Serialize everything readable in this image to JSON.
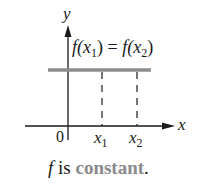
{
  "diagram": {
    "axes": {
      "y_label": "y",
      "x_label": "x",
      "origin_label": "0"
    },
    "points": [
      {
        "name": "x",
        "sub": "1"
      },
      {
        "name": "x",
        "sub": "2"
      }
    ],
    "equation": {
      "lhs_fn": "f(",
      "lhs_var": "x",
      "lhs_sub": "1",
      "lhs_close": ")",
      "op": " = ",
      "rhs_fn": "f(",
      "rhs_var": "x",
      "rhs_sub": "2",
      "rhs_close": ")"
    },
    "caption": {
      "fn": "f",
      "text": " is ",
      "keyword": "constant",
      "end": "."
    },
    "colors": {
      "axis": "#1a1a1a",
      "function_line": "#8c8c8c",
      "keyword": "#8a8a8a",
      "dashed": "#1a1a1a"
    }
  }
}
